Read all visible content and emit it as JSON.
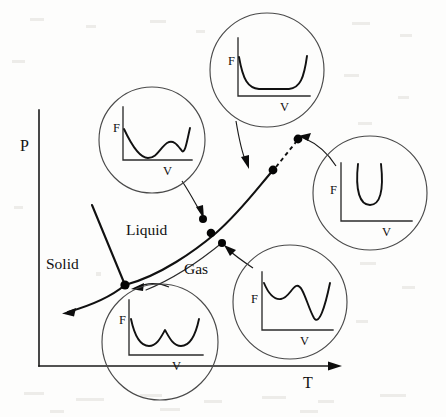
{
  "figure": {
    "kind": "phase-diagram-with-free-energy-insets"
  },
  "axes": {
    "y_label": "P",
    "x_label": "T",
    "y_axis": {
      "x": 39,
      "y_top": 110,
      "y_bottom": 366
    },
    "x_axis": {
      "y": 366,
      "x_left": 39,
      "x_right": 338
    }
  },
  "regions": [
    {
      "id": "solid",
      "label": "Solid",
      "x": 46,
      "y": 265
    },
    {
      "id": "liquid",
      "label": "Liquid",
      "x": 126,
      "y": 230
    },
    {
      "id": "gas",
      "label": "Gas",
      "x": 184,
      "y": 270
    }
  ],
  "phase_boundaries": [
    {
      "id": "fusion-curve",
      "name": "solid-liquid boundary",
      "path": "M 92 205 L 125 285"
    },
    {
      "id": "sublimation-curve",
      "name": "solid-gas boundary",
      "path": "M 125 285 C 112 296 96 304 68 312"
    },
    {
      "id": "vaporization-curve",
      "name": "liquid-gas coexistence curve",
      "path": "M 125 285 C 160 276 196 250 216 233 C 240 212 256 190 273 170"
    },
    {
      "id": "metastable-spinodal",
      "name": "thin spinodal guide line",
      "path": "M 146 290 C 178 276 206 256 222 243"
    },
    {
      "id": "supercritical-extension",
      "name": "dashed supercritical continuation",
      "path": "M 275 168 L 297 140"
    }
  ],
  "markers": [
    {
      "id": "triple-point",
      "x": 125,
      "y": 285,
      "r": 4.6
    },
    {
      "id": "point-liquid-side",
      "x": 203,
      "y": 219,
      "r": 4.0
    },
    {
      "id": "point-on-coexistence",
      "x": 211,
      "y": 233,
      "r": 4.3
    },
    {
      "id": "point-gas-side",
      "x": 222,
      "y": 243,
      "r": 4.0
    },
    {
      "id": "critical-point",
      "x": 273,
      "y": 170,
      "r": 4.4
    },
    {
      "id": "point-supercritical",
      "x": 298,
      "y": 139,
      "r": 4.4
    }
  ],
  "insets": [
    {
      "id": "inset-liquid",
      "position": "middle-left",
      "cx": 152,
      "cy": 140,
      "r": 53,
      "f_label": "F",
      "v_label": "V",
      "shape": "asymmetric double well, left minimum deeper",
      "origin_x": 123,
      "baseline_y": 160,
      "axis_top_y": 107,
      "axis_right_x": 192,
      "curve": "M 124 129 C 131 144 139 158 148 158 C 157 158 160 148 167 143 C 174 139 178 146 182 151 C 185 154 187 141 190 128"
    },
    {
      "id": "inset-coexistence",
      "position": "top-center",
      "cx": 267,
      "cy": 70,
      "r": 57,
      "f_label": "F",
      "v_label": "V",
      "shape": "wide flat-bottomed well, two-phase coexistence",
      "origin_x": 238,
      "baseline_y": 96,
      "axis_top_y": 38,
      "axis_right_x": 310,
      "curve": "M 239 58 C 243 80 248 88 259 89 L 289 89 C 300 88 304 78 307 57"
    },
    {
      "id": "inset-supercritical",
      "position": "middle-right",
      "cx": 370,
      "cy": 193,
      "r": 57,
      "f_label": "F",
      "v_label": "V",
      "shape": "single narrow U-shaped well",
      "origin_x": 341,
      "baseline_y": 221,
      "axis_top_y": 163,
      "axis_right_x": 412,
      "curve": "M 358 164 C 356 190 360 205 370 205 C 380 205 383 190 381 164"
    },
    {
      "id": "inset-triple",
      "position": "bottom-center",
      "cx": 160,
      "cy": 342,
      "r": 58,
      "f_label": "F",
      "v_label": "V",
      "shape": "symmetric double well",
      "origin_x": 129,
      "baseline_y": 355,
      "axis_top_y": 300,
      "axis_right_x": 203,
      "curve": "M 131 319 C 135 338 141 346 149 346 C 157 346 161 337 165 330 C 169 337 173 346 181 346 C 189 346 195 338 199 319"
    },
    {
      "id": "inset-gas",
      "position": "bottom-right",
      "cx": 290,
      "cy": 302,
      "r": 57,
      "f_label": "F",
      "v_label": "V",
      "shape": "asymmetric double well, right minimum deeper",
      "origin_x": 262,
      "baseline_y": 330,
      "axis_top_y": 272,
      "axis_right_x": 333,
      "curve": "M 263 284 C 268 295 273 300 280 299 C 287 298 290 289 295 286 C 302 283 307 305 314 318 C 319 326 325 307 330 283"
    }
  ],
  "leaders": [
    {
      "id": "leader-liquid",
      "from_inset": "inset-liquid",
      "path": "M 182 181 C 192 196 198 208 202 214",
      "arrow_at": [
        203,
        218
      ],
      "arrow_angle": 68
    },
    {
      "id": "leader-coexistence",
      "from_inset": "inset-coexistence",
      "path": "M 235 121 C 239 139 243 155 247 163",
      "arrow_at": [
        249,
        167
      ],
      "arrow_angle": 70
    },
    {
      "id": "leader-supercritical",
      "from_inset": "inset-supercritical",
      "path": "M 336 166 C 325 150 312 141 303 138",
      "arrow_at": [
        299,
        137
      ],
      "arrow_angle": 194
    },
    {
      "id": "leader-triple",
      "from_inset": "inset-triple",
      "path": "M 167 286 C 157 282 145 283 137 287",
      "arrow_at": [
        133,
        289
      ],
      "arrow_angle": 200
    },
    {
      "id": "leader-gas",
      "from_inset": "inset-gas",
      "path": "M 252 267 C 243 261 234 256 228 249",
      "arrow_at": [
        225,
        246
      ],
      "arrow_angle": 225
    }
  ]
}
